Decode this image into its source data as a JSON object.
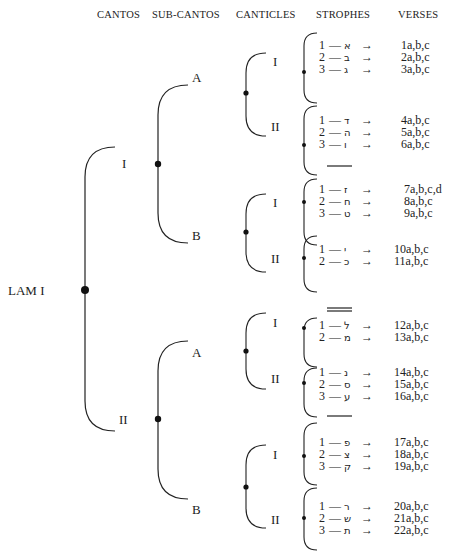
{
  "headers": {
    "cantos": "CANTOS",
    "sub_cantos": "SUB-CANTOS",
    "canticles": "CANTICLES",
    "strophes": "STROPHES",
    "verses": "VERSES"
  },
  "root": {
    "label": "LAM I"
  },
  "cantos": [
    {
      "label": "I"
    },
    {
      "label": "II"
    }
  ],
  "sub_cantos": [
    {
      "label": "A"
    },
    {
      "label": "B"
    },
    {
      "label": "A"
    },
    {
      "label": "B"
    }
  ],
  "canticles": [
    {
      "label": "I"
    },
    {
      "label": "II"
    },
    {
      "label": "I"
    },
    {
      "label": "II"
    },
    {
      "label": "I"
    },
    {
      "label": "II"
    },
    {
      "label": "I"
    },
    {
      "label": "II"
    }
  ],
  "arrow": "→",
  "dash": "—",
  "rows": [
    {
      "num": "1",
      "letter": "א",
      "verse": "1a,b,c"
    },
    {
      "num": "2",
      "letter": "ב",
      "verse": "2a,b,c"
    },
    {
      "num": "3",
      "letter": "ג",
      "verse": "3a,b,c"
    },
    {
      "num": "1",
      "letter": "ד",
      "verse": "4a,b,c"
    },
    {
      "num": "2",
      "letter": "ה",
      "verse": "5a,b,c"
    },
    {
      "num": "3",
      "letter": "ו",
      "verse": "6a,b,c"
    },
    {
      "num": "1",
      "letter": "ז",
      "verse": "7a,b,c,d"
    },
    {
      "num": "2",
      "letter": "ח",
      "verse": "8a,b,c"
    },
    {
      "num": "3",
      "letter": "ט",
      "verse": "9a,b,c"
    },
    {
      "num": "1",
      "letter": "י",
      "verse": "10a,b,c"
    },
    {
      "num": "2",
      "letter": "כ",
      "verse": "11a,b,c"
    },
    {
      "num": "1",
      "letter": "ל",
      "verse": "12a,b,c"
    },
    {
      "num": "2",
      "letter": "מ",
      "verse": "13a,b,c"
    },
    {
      "num": "1",
      "letter": "נ",
      "verse": "14a,b,c"
    },
    {
      "num": "2",
      "letter": "ס",
      "verse": "15a,b,c"
    },
    {
      "num": "3",
      "letter": "ע",
      "verse": "16a,b,c"
    },
    {
      "num": "1",
      "letter": "פ",
      "verse": "17a,b,c"
    },
    {
      "num": "2",
      "letter": "צ",
      "verse": "18a,b,c"
    },
    {
      "num": "3",
      "letter": "ק",
      "verse": "19a,b,c"
    },
    {
      "num": "1",
      "letter": "ר",
      "verse": "20a,b,c"
    },
    {
      "num": "2",
      "letter": "ש",
      "verse": "21a,b,c"
    },
    {
      "num": "3",
      "letter": "ת",
      "verse": "22a,b,c"
    }
  ]
}
